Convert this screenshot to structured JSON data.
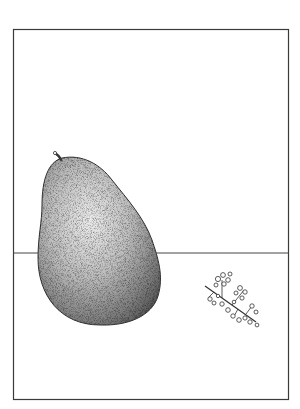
{
  "artwork": {
    "subject": "Still life: pear and a sprig on a table",
    "frame_color": "#3a3a3a",
    "background_color": "#ffffff",
    "objects": [
      {
        "name": "pear",
        "description": "Large stippled pear with stem, left of center"
      },
      {
        "name": "sprig",
        "description": "Small flowering sprig lying on the table, right"
      },
      {
        "name": "table-edge",
        "description": "Horizontal line marking back edge of table"
      }
    ]
  }
}
